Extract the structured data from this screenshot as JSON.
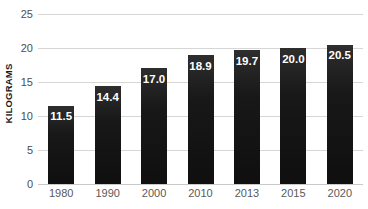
{
  "chart_data": {
    "type": "bar",
    "title": "",
    "xlabel": "",
    "ylabel": "KILOGRAMS",
    "categories": [
      "1980",
      "1990",
      "2000",
      "2010",
      "2013",
      "2015",
      "2020"
    ],
    "values": [
      11.5,
      14.4,
      17.0,
      18.9,
      19.7,
      20.0,
      20.5
    ],
    "value_labels": [
      "11.5",
      "14.4",
      "17.0",
      "18.9",
      "19.7",
      "20.0",
      "20.5"
    ],
    "ylim": [
      0,
      25
    ],
    "ytick_values": [
      0,
      5,
      10,
      15,
      20,
      25
    ],
    "ytick_labels": [
      "0",
      "5",
      "10",
      "15",
      "20",
      "25"
    ],
    "grid": true,
    "legend": false,
    "legend_position": "none",
    "series": [
      {
        "name": "",
        "values": [
          11.5,
          14.4,
          17.0,
          18.9,
          19.7,
          20.0,
          20.5
        ],
        "color": "#1a1a1a"
      }
    ],
    "colors": {
      "bar": "#1a1a1a",
      "gridline": "#d6d6d6",
      "background": "#ffffff",
      "tick_label": "#4d4d4d",
      "category_label": "#595959",
      "data_label": "#ffffff",
      "axis_title": "#1a1a1a"
    }
  }
}
